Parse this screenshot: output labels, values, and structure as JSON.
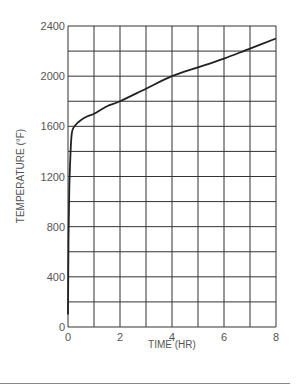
{
  "chart_data": {
    "type": "line",
    "title": "",
    "xlabel": "TIME (HR)",
    "ylabel": "TEMPERATURE (°F)",
    "xlim": [
      0,
      8
    ],
    "ylim": [
      0,
      2400
    ],
    "x_ticks": [
      0,
      2,
      4,
      6,
      8
    ],
    "y_ticks": [
      0,
      400,
      800,
      1200,
      1600,
      2000,
      2400
    ],
    "x_grid_step": 1,
    "y_grid_step": 200,
    "grid": true,
    "legend": null,
    "series": [
      {
        "name": "Time-temperature curve",
        "x": [
          0,
          0.02,
          0.05,
          0.1,
          0.15,
          0.25,
          0.5,
          0.75,
          1,
          1.5,
          2,
          3,
          4,
          5,
          6,
          7,
          8
        ],
        "y": [
          100,
          700,
          1100,
          1400,
          1550,
          1600,
          1650,
          1680,
          1700,
          1760,
          1800,
          1900,
          2000,
          2070,
          2140,
          2220,
          2300
        ]
      }
    ],
    "colors": {
      "line": "#222222",
      "grid": "#333333",
      "text": "#555555"
    }
  }
}
